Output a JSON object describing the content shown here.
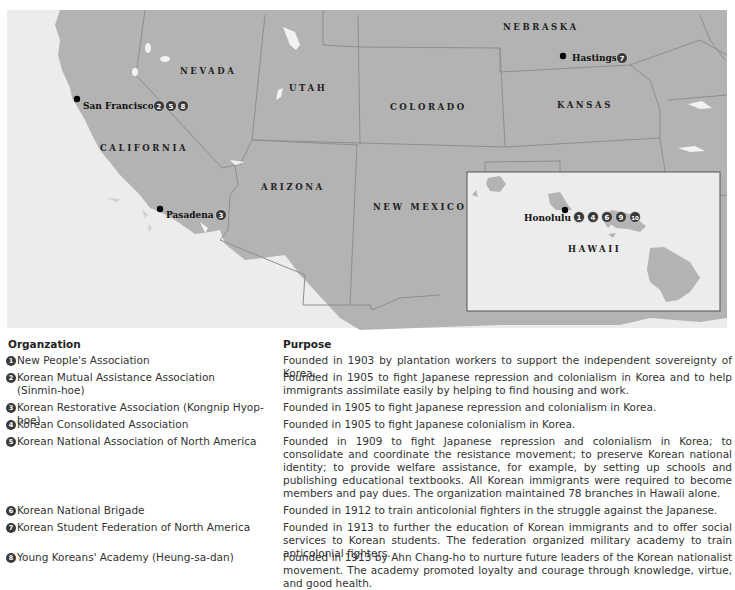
{
  "map": {
    "colors": {
      "land": "#b3b3b3",
      "ocean": "#ececec",
      "border": "#8e8e8e",
      "lakes": "#f2f2f2",
      "inset_bg": "#ececec",
      "inset_border": "#555555",
      "badge": "#3a3a3a"
    },
    "states": {
      "nevada": "NEVADA",
      "utah": "UTAH",
      "california": "CALIFORNIA",
      "colorado": "COLORADO",
      "nebraska": "NEBRASKA",
      "kansas": "KANSAS",
      "arizona": "ARIZONA",
      "new_mexico": "NEW MEXICO",
      "hawaii": "HAWAII"
    },
    "cities": {
      "san_francisco": {
        "name": "San Francisco",
        "badges": [
          "2",
          "5",
          "8"
        ]
      },
      "pasadena": {
        "name": "Pasadena",
        "badges": [
          "3"
        ]
      },
      "hastings": {
        "name": "Hastings",
        "badges": [
          "7"
        ]
      },
      "honolulu": {
        "name": "Honolulu",
        "badges": [
          "1",
          "4",
          "6",
          "9",
          "10"
        ]
      }
    }
  },
  "legend": {
    "headers": {
      "organization": "Organzation",
      "purpose": "Purpose"
    },
    "rows": [
      {
        "num": "1",
        "org": "New People's Association",
        "purpose": "Founded in 1903 by plantation workers to support the independent sovereignty of Korea."
      },
      {
        "num": "2",
        "org": "Korean Mutual Assistance Association (Sinmin-hoe)",
        "purpose": "Founded in 1905 to fight Japanese repression and colonialism in Korea and to help immigrants assimilate easily by helping to find housing and work."
      },
      {
        "num": "3",
        "org": "Korean Restorative Association (Kongnip Hyop-hoe)",
        "purpose": "Founded in 1905 to fight Japanese repression and colonialism in Korea."
      },
      {
        "num": "4",
        "org": "Korean Consolidated Association",
        "purpose": "Founded in 1905 to fight Japanese colonialism in Korea."
      },
      {
        "num": "5",
        "org": "Korean National Association of North America",
        "purpose": "Founded in 1909 to fight Japanese repression and colonialism in Korea; to consolidate and coordinate the resistance movement; to preserve Korean national identity; to provide welfare assistance, for example, by setting up schools and publishing educational textbooks. All Korean immigrants were required to become members and pay dues. The organization maintained 78 branches in Hawaii alone."
      },
      {
        "num": "6",
        "org": "Korean National Brigade",
        "purpose": "Founded in 1912 to train anticolonial fighters in the struggle against the Japanese."
      },
      {
        "num": "7",
        "org": "Korean Student Federation of North America",
        "purpose": "Founded in 1913 to further the education of Korean immigrants and to offer social services to Korean students. The federation organized military academy to train anticolonial fighters."
      },
      {
        "num": "8",
        "org": "Young Koreans' Academy (Heung-sa-dan)",
        "purpose": "Founded in 1913 by Ahn Chang-ho to nurture future leaders of the Korean nationalist movement. The academy promoted loyalty and courage through knowledge, virtue, and good health."
      }
    ]
  }
}
